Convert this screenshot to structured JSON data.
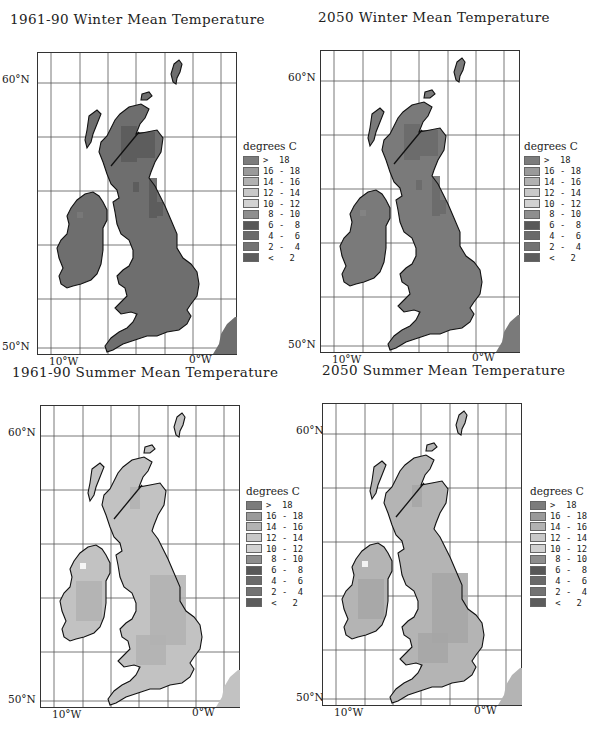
{
  "panels": [
    {
      "id": "winter-1961-90",
      "title": "1961-90 Winter Mean Temperature",
      "lat_top": "60°N",
      "lat_bottom": "50°N",
      "lon_left": "10°W",
      "lon_right": "0°W",
      "land_color": "#6e6e6e",
      "patch_color": "#5a5a5a",
      "patch_light": "#7a7a7a",
      "legend_title": "degrees C"
    },
    {
      "id": "winter-2050",
      "title": "2050 Winter Mean Temperature",
      "lat_top": "60°N",
      "lat_bottom": "50°N",
      "lon_left": "10°W",
      "lon_right": "0°W",
      "land_color": "#7a7a7a",
      "patch_color": "#6a6a6a",
      "patch_light": "#858585",
      "legend_title": "degrees C"
    },
    {
      "id": "summer-1961-90",
      "title": "1961-90 Summer Mean Temperature",
      "lat_top": "60°N",
      "lat_bottom": "50°N",
      "lon_left": "10°W",
      "lon_right": "0°W",
      "land_color": "#c2c2c2",
      "patch_color": "#b2b2b2",
      "patch_light": "#cfcfcf",
      "legend_title": "degrees C"
    },
    {
      "id": "summer-2050",
      "title": "2050 Summer Mean Temperature",
      "lat_top": "60°N",
      "lat_bottom": "50°N",
      "lon_left": "10°W",
      "lon_right": "0°W",
      "land_color": "#b4b4b4",
      "patch_color": "#a6a6a6",
      "patch_light": "#c4c4c4",
      "legend_title": "degrees C"
    }
  ],
  "legend": {
    "title": "degrees C",
    "items": [
      {
        "label": ">  18",
        "color": "#7c7c7c"
      },
      {
        "label": "16 - 18",
        "color": "#9a9a9a"
      },
      {
        "label": "14 - 16",
        "color": "#b2b2b2"
      },
      {
        "label": "12 - 14",
        "color": "#c8c8c8"
      },
      {
        "label": "10 - 12",
        "color": "#d2d2d2"
      },
      {
        "label": " 8 - 10",
        "color": "#8e8e8e"
      },
      {
        "label": " 6 -  8",
        "color": "#585858"
      },
      {
        "label": " 4 -  6",
        "color": "#6a6a6a"
      },
      {
        "label": " 2 -  4",
        "color": "#737373"
      },
      {
        "label": " <   2",
        "color": "#5c5c5c"
      }
    ]
  },
  "chart_data": [
    {
      "type": "heatmap",
      "title": "1961-90 Winter Mean Temperature",
      "region": "British Isles",
      "xlabel": "Longitude",
      "ylabel": "Latitude",
      "x_ticks": [
        "10°W",
        "0°W"
      ],
      "y_ticks": [
        "60°N",
        "50°N"
      ],
      "legend_title": "degrees C",
      "legend": [
        "> 18",
        "16 - 18",
        "14 - 16",
        "12 - 14",
        "10 - 12",
        "8 - 10",
        "6 - 8",
        "4 - 6",
        "2 - 4",
        "< 2"
      ],
      "dominant_class": "2 - 4 / 4 - 6",
      "notes": "Lowland areas mostly 4-6 C; Scottish Highlands and Pennines colder (<2 to 2-4 C)"
    },
    {
      "type": "heatmap",
      "title": "2050 Winter Mean Temperature",
      "region": "British Isles",
      "xlabel": "Longitude",
      "ylabel": "Latitude",
      "x_ticks": [
        "10°W",
        "0°W"
      ],
      "y_ticks": [
        "60°N",
        "50°N"
      ],
      "legend_title": "degrees C",
      "legend": [
        "> 18",
        "16 - 18",
        "14 - 16",
        "12 - 14",
        "10 - 12",
        "8 - 10",
        "6 - 8",
        "4 - 6",
        "2 - 4",
        "< 2"
      ],
      "dominant_class": "4 - 6 / 6 - 8",
      "notes": "Warmer overall than 1961-90; Scottish Highlands 2-4 C"
    },
    {
      "type": "heatmap",
      "title": "1961-90 Summer Mean Temperature",
      "region": "British Isles",
      "xlabel": "Longitude",
      "ylabel": "Latitude",
      "x_ticks": [
        "10°W",
        "0°W"
      ],
      "y_ticks": [
        "60°N",
        "50°N"
      ],
      "legend_title": "degrees C",
      "legend": [
        "> 18",
        "16 - 18",
        "14 - 16",
        "12 - 14",
        "10 - 12",
        "8 - 10",
        "6 - 8",
        "4 - 6",
        "2 - 4",
        "< 2"
      ],
      "dominant_class": "12 - 14 / 14 - 16",
      "notes": "Southern England and central Ireland 14-16 C; Scotland 12-14 C with patches 10-12 C"
    },
    {
      "type": "heatmap",
      "title": "2050 Summer Mean Temperature",
      "region": "British Isles",
      "xlabel": "Longitude",
      "ylabel": "Latitude",
      "x_ticks": [
        "10°W",
        "0°W"
      ],
      "y_ticks": [
        "60°N",
        "50°N"
      ],
      "legend_title": "degrees C",
      "legend": [
        "> 18",
        "16 - 18",
        "14 - 16",
        "12 - 14",
        "10 - 12",
        "8 - 10",
        "6 - 8",
        "4 - 6",
        "2 - 4",
        "< 2"
      ],
      "dominant_class": "14 - 16 / 16 - 18",
      "notes": "South-east England 16-18 C; most of Britain and Ireland 14-16 C; Scotland 12-14 C"
    }
  ]
}
